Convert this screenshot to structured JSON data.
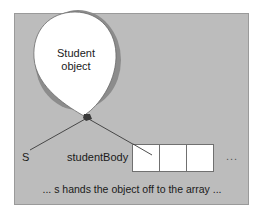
{
  "diagram": {
    "balloon": {
      "label_line1": "Student",
      "label_line2": "object",
      "fill": "#ffffff",
      "shadow": "#8c8c8c"
    },
    "variable": {
      "name": "S"
    },
    "array": {
      "name": "studentBody",
      "cell_count": 3,
      "continuation": "..."
    },
    "caption": "... s hands the object off to the array ...",
    "colors": {
      "panel_bg": "#bcbcbc",
      "panel_border": "#9a9a9a",
      "line": "#3a3a3a",
      "cell_border": "#707070"
    }
  }
}
